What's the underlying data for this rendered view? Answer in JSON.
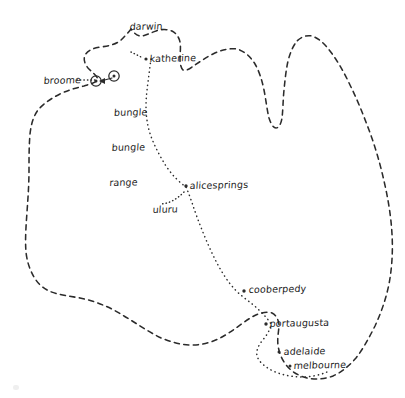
{
  "map": {
    "title": "Australia hand-drawn travel map",
    "background_color": "#ffffff",
    "ink_color": "#2b2b2b",
    "outline_style": "dashed",
    "route_style": "dotted",
    "width": 405,
    "height": 398
  },
  "places": [
    {
      "id": "darwin",
      "label": "darwin",
      "x": 130,
      "y": 27,
      "marker": "none",
      "label_lines": [
        "darwin"
      ]
    },
    {
      "id": "katherine",
      "label": "katherine",
      "x": 150,
      "y": 58,
      "marker": "dot",
      "label_lines": [
        "katherine"
      ]
    },
    {
      "id": "broome",
      "label": "broome",
      "x": 44,
      "y": 79,
      "marker": "circle",
      "label_lines": [
        "broome"
      ]
    },
    {
      "id": "bungle-bungle-range",
      "label": "bungle bungle range",
      "x": 115,
      "y": 86,
      "marker": "circle",
      "label_lines": [
        "bungle",
        "bungle",
        "range"
      ]
    },
    {
      "id": "alicesprings",
      "label": "alicesprings",
      "x": 190,
      "y": 185,
      "marker": "dot",
      "label_lines": [
        "alicesprings"
      ]
    },
    {
      "id": "uluru",
      "label": "uluru",
      "x": 155,
      "y": 208,
      "marker": "none",
      "label_lines": [
        "uluru"
      ]
    },
    {
      "id": "cooberpedy",
      "label": "cooberpedy",
      "x": 250,
      "y": 288,
      "marker": "dot",
      "label_lines": [
        "cooberpedy"
      ]
    },
    {
      "id": "portaugusta",
      "label": "portaugusta",
      "x": 270,
      "y": 323,
      "marker": "dot",
      "label_lines": [
        "portaugusta"
      ]
    },
    {
      "id": "adelaide",
      "label": "adelaide",
      "x": 283,
      "y": 350,
      "marker": "dot",
      "label_lines": [
        "adelaide"
      ]
    },
    {
      "id": "melbourne",
      "label": "melbourne",
      "x": 295,
      "y": 364,
      "marker": "dot",
      "label_lines": [
        "melbourne"
      ]
    }
  ],
  "geometry": {
    "coastline_path": "M 131 29 C 128 33 124 37 120 41 C 114 45 108 46 101 47 C 94 48 88 50 85 55 C 83 60 85 64 88 68 C 92 72 96 75 98 79 C 96 83 90 84 84 86 C 76 88 68 90 60 94 C 52 98 44 103 38 110 C 33 117 31 125 30 134 C 29 146 29 158 29 170 C 29 184 28 198 27 212 C 26 226 25 240 26 252 C 27 262 30 270 34 277 C 38 284 43 288 49 291 C 58 295 69 296 80 298 C 95 301 110 307 124 316 C 136 323 147 331 159 337 C 170 342 181 345 192 345 C 203 345 213 342 222 337 C 233 331 242 323 252 317 C 259 313 266 311 272 313 C 276 315 278 319 279 324 C 279 331 277 338 278 345 C 279 353 282 360 287 366 C 292 372 299 376 307 378 C 316 380 325 379 333 376 C 342 372 349 366 356 358 C 363 349 369 338 375 326 C 381 313 386 299 389 284 C 392 268 393 251 392 234 C 391 216 388 198 384 181 C 380 163 375 146 369 130 C 363 114 357 99 350 85 C 344 72 337 60 330 51 C 324 43 318 38 312 36 C 306 35 301 37 297 41 C 293 46 290 53 288 61 C 286 70 285 80 284 90 C 283 100 283 110 282 118 C 281 124 279 128 276 128 C 273 128 271 124 269 118 C 267 110 266 100 264 90 C 262 80 259 71 255 64 C 250 56 244 51 237 49 C 229 48 221 50 213 54 C 205 58 198 63 192 67 C 188 70 185 71 183 70 C 181 68 180 64 180 59 C 180 53 181 47 180 42 C 179 37 176 33 172 31 C 167 29 161 29 156 31 C 150 33 145 36 141 36 C 137 36 134 33 131 29 Z",
    "route_path": "M 151 59 C 150 66 149 74 148 82 C 147 90 146 98 146 106 C 146 118 148 129 152 139 C 156 149 161 158 166 166 C 172 175 179 182 186 187 C 190 196 193 206 197 217 C 203 233 210 250 218 265 C 225 278 233 289 242 296 C 248 301 254 305 259 310 C 264 315 268 319 271 324 C 270 331 266 336 262 341 C 258 346 256 351 257 356 C 259 362 265 367 273 371 C 282 375 292 377 302 377 C 311 377 320 375 327 372",
    "spur_broome_path": "M 77 80 C 83 80 90 80 96 80",
    "spur_uluru_path": "M 184 192 C 180 196 176 199 172 201 C 168 203 164 204 160 204",
    "spur_katherine_path": "M 131 52 C 135 54 139 56 143 58",
    "arrow_broome": {
      "x1": 112,
      "y1": 78,
      "x2": 99,
      "y2": 81
    },
    "markers": [
      {
        "id": "broome-ring",
        "cx": 96,
        "cy": 81,
        "r": 5.2,
        "ring": true
      },
      {
        "id": "bungle-ring",
        "cx": 114,
        "cy": 76,
        "r": 5.2,
        "ring": true
      },
      {
        "id": "katherine-dot",
        "cx": 146,
        "cy": 59,
        "r": 1.5,
        "ring": false
      },
      {
        "id": "alice-dot",
        "cx": 186,
        "cy": 186,
        "r": 1.6,
        "ring": false
      },
      {
        "id": "cooberpedy-dot",
        "cx": 244,
        "cy": 291,
        "r": 1.6,
        "ring": false
      },
      {
        "id": "portaugusta-dot",
        "cx": 266,
        "cy": 324,
        "r": 1.6,
        "ring": false
      },
      {
        "id": "adelaide-dot",
        "cx": 279,
        "cy": 352,
        "r": 1.5,
        "ring": false
      },
      {
        "id": "melbourne-dot",
        "cx": 290,
        "cy": 366,
        "r": 1.5,
        "ring": false
      }
    ]
  }
}
